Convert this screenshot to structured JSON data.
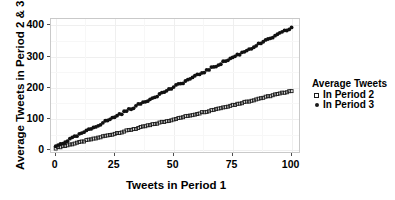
{
  "chart_data": {
    "type": "scatter",
    "title": "",
    "xlabel": "Tweets in Period 1",
    "ylabel": "Average Tweets in Period 2 & 3",
    "xlim": [
      -2,
      104
    ],
    "ylim": [
      -12,
      420
    ],
    "xticks": [
      0,
      25,
      50,
      75,
      100
    ],
    "yticks": [
      0,
      100,
      200,
      300,
      400
    ],
    "grid": true,
    "legend_position": "right",
    "legend_title": "Average Tweets",
    "series": [
      {
        "name": "In Period 2",
        "marker": "open-square",
        "color": "#1a1a1a",
        "intercept": 8,
        "slope": 1.82,
        "x": [
          0,
          1,
          2,
          3,
          4,
          5,
          6,
          7,
          8,
          9,
          10,
          11,
          12,
          13,
          14,
          15,
          16,
          17,
          18,
          19,
          20,
          21,
          22,
          23,
          24,
          25,
          26,
          27,
          28,
          29,
          30,
          31,
          32,
          33,
          34,
          35,
          36,
          37,
          38,
          39,
          40,
          41,
          42,
          43,
          44,
          45,
          46,
          47,
          48,
          49,
          50,
          51,
          52,
          53,
          54,
          55,
          56,
          57,
          58,
          59,
          60,
          61,
          62,
          63,
          64,
          65,
          66,
          67,
          68,
          69,
          70,
          71,
          72,
          73,
          74,
          75,
          76,
          77,
          78,
          79,
          80,
          81,
          82,
          83,
          84,
          85,
          86,
          87,
          88,
          89,
          90,
          91,
          92,
          93,
          94,
          95,
          96,
          97,
          98,
          99,
          100
        ],
        "values": [
          7,
          9,
          11,
          13,
          14,
          16,
          18,
          20,
          22,
          24,
          25,
          27,
          29,
          31,
          33,
          35,
          36,
          38,
          40,
          42,
          44,
          46,
          47,
          49,
          51,
          53,
          55,
          57,
          58,
          60,
          62,
          64,
          66,
          68,
          69,
          71,
          73,
          75,
          77,
          79,
          80,
          82,
          84,
          86,
          88,
          90,
          91,
          93,
          95,
          97,
          99,
          101,
          102,
          104,
          106,
          108,
          110,
          112,
          113,
          115,
          117,
          119,
          121,
          123,
          124,
          126,
          128,
          130,
          132,
          134,
          135,
          137,
          139,
          141,
          143,
          145,
          146,
          148,
          150,
          152,
          154,
          156,
          157,
          159,
          161,
          163,
          165,
          167,
          168,
          170,
          172,
          174,
          176,
          178,
          179,
          181,
          183,
          185,
          187,
          189,
          190
        ]
      },
      {
        "name": "In Period 3",
        "marker": "filled-dot",
        "color": "#111111",
        "intercept": 12,
        "slope": 3.78,
        "x": [
          0,
          1,
          2,
          3,
          4,
          5,
          6,
          7,
          8,
          9,
          10,
          11,
          12,
          13,
          14,
          15,
          16,
          17,
          18,
          19,
          20,
          21,
          22,
          23,
          24,
          25,
          26,
          27,
          28,
          29,
          30,
          31,
          32,
          33,
          34,
          35,
          36,
          37,
          38,
          39,
          40,
          41,
          42,
          43,
          44,
          45,
          46,
          47,
          48,
          49,
          50,
          51,
          52,
          53,
          54,
          55,
          56,
          57,
          58,
          59,
          60,
          61,
          62,
          63,
          64,
          65,
          66,
          67,
          68,
          69,
          70,
          71,
          72,
          73,
          74,
          75,
          76,
          77,
          78,
          79,
          80,
          81,
          82,
          83,
          84,
          85,
          86,
          87,
          88,
          89,
          90,
          91,
          92,
          93,
          94,
          95,
          96,
          97,
          98,
          99,
          100
        ],
        "values": [
          12,
          16,
          20,
          23,
          27,
          31,
          35,
          39,
          42,
          46,
          50,
          54,
          58,
          61,
          65,
          69,
          73,
          77,
          80,
          84,
          88,
          92,
          96,
          99,
          103,
          107,
          111,
          115,
          118,
          122,
          126,
          130,
          134,
          137,
          141,
          145,
          149,
          153,
          156,
          160,
          164,
          168,
          172,
          175,
          179,
          183,
          187,
          191,
          194,
          198,
          202,
          206,
          210,
          213,
          217,
          221,
          225,
          229,
          232,
          236,
          240,
          244,
          248,
          251,
          255,
          259,
          263,
          267,
          270,
          274,
          278,
          282,
          286,
          289,
          293,
          297,
          301,
          305,
          308,
          312,
          316,
          320,
          324,
          327,
          331,
          335,
          339,
          343,
          346,
          350,
          354,
          358,
          362,
          365,
          369,
          373,
          377,
          381,
          384,
          388,
          392
        ]
      }
    ]
  },
  "legend": {
    "title": "Average Tweets",
    "items": [
      {
        "label": "In Period 2",
        "marker": "open-square"
      },
      {
        "label": "In Period 3",
        "marker": "filled-dot"
      }
    ]
  },
  "axes": {
    "x_title": "Tweets in Period 1",
    "y_title": "Average Tweets in Period 2 & 3",
    "x_tick_labels": [
      "0",
      "25",
      "50",
      "75",
      "100"
    ],
    "y_tick_labels": [
      "0",
      "100",
      "200",
      "300",
      "400"
    ]
  },
  "colors": {
    "series_period2": "#1a1a1a",
    "series_period3": "#111111",
    "panel_border": "#c9c9c9",
    "grid": "#efefef",
    "background": "#ffffff",
    "text": "#000000"
  }
}
